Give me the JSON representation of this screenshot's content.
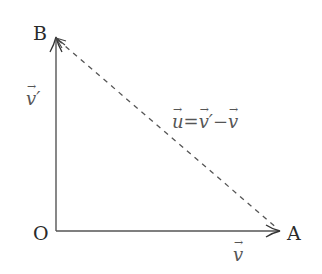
{
  "diagram": {
    "title": "",
    "points": {
      "O": {
        "label": "O",
        "x": 56,
        "y": 231
      },
      "A": {
        "label": "A",
        "x": 280,
        "y": 231
      },
      "B": {
        "label": "B",
        "x": 56,
        "y": 38
      }
    },
    "vectors": [
      {
        "id": "v",
        "from": "O",
        "to": "A",
        "style": "solid",
        "label": "v",
        "label_suffix": ""
      },
      {
        "id": "v_prime",
        "from": "O",
        "to": "B",
        "style": "solid",
        "label": "v",
        "label_suffix": "′"
      },
      {
        "id": "u",
        "from": "B",
        "to": "A",
        "style": "dashed",
        "label": "u = v′ − v"
      }
    ],
    "equation": {
      "u": "u",
      "eq": "=",
      "v1": "v",
      "prime": "′",
      "minus": "−",
      "v2": "v"
    },
    "colors": {
      "line": "#555555",
      "text": "#2a2a2a",
      "vector_label": "#555555"
    }
  }
}
